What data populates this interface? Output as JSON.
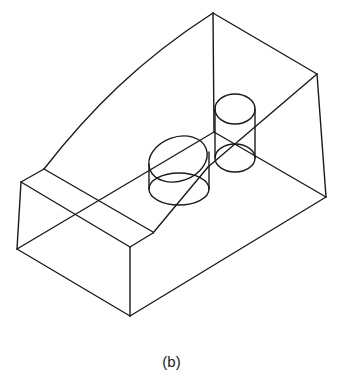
{
  "figure": {
    "caption": "(b)",
    "line_color": "#1a1a1a",
    "background": "#ffffff"
  }
}
